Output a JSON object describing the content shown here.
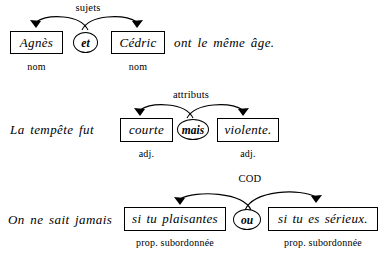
{
  "document": {
    "title": "Analyse grammaticale — coordination",
    "language": "fr"
  },
  "rows": [
    {
      "id": "row-1",
      "function_label": "sujets",
      "lead_text": "",
      "trail_text": "ont le même âge.",
      "conjunction": "et",
      "boxes": [
        {
          "text": "Agnès",
          "pos_label": "nom"
        },
        {
          "text": "Cédric",
          "pos_label": "nom"
        }
      ]
    },
    {
      "id": "row-2",
      "function_label": "attributs",
      "lead_text": "La tempête fut",
      "trail_text": "",
      "conjunction": "mais",
      "boxes": [
        {
          "text": "courte",
          "pos_label": "adj."
        },
        {
          "text": "violente.",
          "pos_label": "adj."
        }
      ]
    },
    {
      "id": "row-3",
      "function_label": "COD",
      "lead_text": "On ne sait jamais",
      "trail_text": "",
      "conjunction": "ou",
      "boxes": [
        {
          "text": "si tu plaisantes",
          "pos_label": "prop. subordonnée"
        },
        {
          "text": "si tu es sérieux.",
          "pos_label": "prop. subordonnée"
        }
      ]
    }
  ],
  "colors": {
    "ink": "#000000",
    "paper": "#ffffff"
  }
}
